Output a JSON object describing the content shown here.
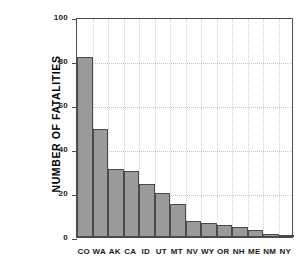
{
  "chart_data": {
    "type": "bar",
    "title": "",
    "xlabel": "",
    "ylabel": "NUMBER OF FATALITIES",
    "ylim": [
      0,
      100
    ],
    "yticks": [
      0,
      20,
      40,
      60,
      80,
      100
    ],
    "grid": "dotted both axes",
    "legend": "none",
    "categories": [
      "CO",
      "WA",
      "AK",
      "CA",
      "ID",
      "UT",
      "MT",
      "NV",
      "WY",
      "OR",
      "NH",
      "ME",
      "NM",
      "NY"
    ],
    "values": [
      82,
      49,
      31,
      30,
      24,
      20,
      15,
      7.5,
      6.5,
      5.5,
      4.5,
      3,
      1.5,
      0.8
    ],
    "bar_color": "#9a9a9a",
    "bar_edge_color": "#4a4a4a"
  }
}
